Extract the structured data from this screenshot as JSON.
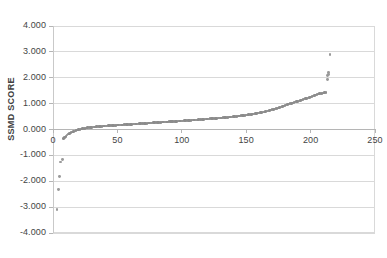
{
  "chart_data": {
    "type": "scatter",
    "title": "",
    "xlabel": "",
    "ylabel": "SSMD SCORE",
    "xlim": [
      0,
      250
    ],
    "ylim": [
      -4.0,
      4.0
    ],
    "grid": true,
    "legend": "none",
    "marker_color": "#8c8c8c",
    "gridline_color": "#d9d9d9",
    "axis_line_color": "#b5b5b5",
    "x_ticks": [
      "0",
      "50",
      "100",
      "150",
      "200",
      "250"
    ],
    "x_tick_values": [
      0,
      50,
      100,
      150,
      200,
      250
    ],
    "y_ticks": [
      "4.000",
      "3.000",
      "2.000",
      "1.000",
      "0.000",
      "-1.000",
      "-2.000",
      "-3.000",
      "-4.000"
    ],
    "y_tick_values": [
      4.0,
      3.0,
      2.0,
      1.0,
      0.0,
      -1.0,
      -2.0,
      -3.0,
      -4.0
    ],
    "series": [
      {
        "name": "SSMD score (rank ordered)",
        "x": [
          3,
          4,
          5,
          6,
          7,
          8,
          9,
          10,
          11,
          12,
          13,
          14,
          15,
          16,
          17,
          18,
          19,
          20,
          21,
          22,
          23,
          24,
          25,
          26,
          27,
          28,
          29,
          30,
          31,
          32,
          33,
          34,
          35,
          36,
          37,
          38,
          39,
          40,
          41,
          42,
          43,
          44,
          45,
          46,
          47,
          48,
          49,
          50,
          51,
          52,
          53,
          54,
          55,
          56,
          57,
          58,
          59,
          60,
          61,
          62,
          63,
          64,
          65,
          66,
          67,
          68,
          69,
          70,
          71,
          72,
          73,
          74,
          75,
          76,
          77,
          78,
          79,
          80,
          81,
          82,
          83,
          84,
          85,
          86,
          87,
          88,
          89,
          90,
          91,
          92,
          93,
          94,
          95,
          96,
          97,
          98,
          99,
          100,
          101,
          102,
          103,
          104,
          105,
          106,
          107,
          108,
          109,
          110,
          111,
          112,
          113,
          114,
          115,
          116,
          117,
          118,
          119,
          120,
          121,
          122,
          123,
          124,
          125,
          126,
          127,
          128,
          129,
          130,
          131,
          132,
          133,
          134,
          135,
          136,
          137,
          138,
          139,
          140,
          141,
          142,
          143,
          144,
          145,
          146,
          147,
          148,
          149,
          150,
          151,
          152,
          153,
          154,
          155,
          156,
          157,
          158,
          159,
          160,
          161,
          162,
          163,
          164,
          165,
          166,
          167,
          168,
          169,
          170,
          171,
          172,
          173,
          174,
          175,
          176,
          177,
          178,
          179,
          180,
          181,
          182,
          183,
          184,
          185,
          186,
          187,
          188,
          189,
          190,
          191,
          192,
          193,
          194,
          195,
          196,
          197,
          198,
          199,
          200,
          201,
          202,
          203,
          204,
          205,
          206,
          207,
          208,
          209,
          210,
          211,
          212,
          213,
          213,
          214,
          214,
          215
        ],
        "y": [
          -3.1,
          -2.3,
          -1.8,
          -1.25,
          -1.15,
          -0.34,
          -0.3,
          -0.26,
          -0.22,
          -0.18,
          -0.15,
          -0.12,
          -0.1,
          -0.08,
          -0.06,
          -0.04,
          -0.02,
          0.0,
          0.01,
          0.02,
          0.03,
          0.04,
          0.05,
          0.06,
          0.07,
          0.075,
          0.08,
          0.085,
          0.09,
          0.095,
          0.1,
          0.105,
          0.11,
          0.115,
          0.12,
          0.125,
          0.13,
          0.133,
          0.136,
          0.14,
          0.143,
          0.146,
          0.15,
          0.153,
          0.156,
          0.16,
          0.163,
          0.166,
          0.17,
          0.173,
          0.176,
          0.18,
          0.183,
          0.186,
          0.19,
          0.193,
          0.196,
          0.2,
          0.203,
          0.206,
          0.21,
          0.213,
          0.216,
          0.22,
          0.223,
          0.226,
          0.23,
          0.233,
          0.236,
          0.24,
          0.243,
          0.246,
          0.25,
          0.253,
          0.256,
          0.26,
          0.263,
          0.266,
          0.27,
          0.273,
          0.276,
          0.28,
          0.283,
          0.286,
          0.29,
          0.293,
          0.296,
          0.3,
          0.303,
          0.306,
          0.31,
          0.313,
          0.316,
          0.32,
          0.323,
          0.326,
          0.33,
          0.333,
          0.336,
          0.34,
          0.343,
          0.346,
          0.35,
          0.353,
          0.356,
          0.36,
          0.363,
          0.366,
          0.37,
          0.374,
          0.378,
          0.382,
          0.386,
          0.39,
          0.394,
          0.398,
          0.402,
          0.406,
          0.41,
          0.414,
          0.418,
          0.422,
          0.426,
          0.43,
          0.434,
          0.438,
          0.442,
          0.446,
          0.45,
          0.455,
          0.46,
          0.465,
          0.47,
          0.475,
          0.48,
          0.485,
          0.49,
          0.495,
          0.5,
          0.506,
          0.512,
          0.518,
          0.524,
          0.53,
          0.537,
          0.544,
          0.551,
          0.558,
          0.565,
          0.572,
          0.58,
          0.588,
          0.596,
          0.604,
          0.612,
          0.62,
          0.63,
          0.64,
          0.65,
          0.66,
          0.672,
          0.684,
          0.696,
          0.708,
          0.72,
          0.734,
          0.748,
          0.762,
          0.776,
          0.79,
          0.806,
          0.822,
          0.838,
          0.854,
          0.87,
          0.888,
          0.906,
          0.924,
          0.942,
          0.96,
          0.978,
          0.996,
          1.012,
          1.028,
          1.044,
          1.06,
          1.076,
          1.092,
          1.108,
          1.124,
          1.14,
          1.156,
          1.172,
          1.188,
          1.204,
          1.22,
          1.24,
          1.26,
          1.28,
          1.3,
          1.32,
          1.34,
          1.355,
          1.37,
          1.38,
          1.39,
          1.4,
          1.41,
          1.42,
          1.43,
          1.95,
          2.08,
          2.12,
          2.2,
          2.9
        ]
      }
    ],
    "notable_outliers": {
      "negative": [
        {
          "x": 3,
          "y": -3.1
        },
        {
          "x": 4,
          "y": -2.3
        },
        {
          "x": 5,
          "y": -1.8
        },
        {
          "x": 6,
          "y": -1.25
        },
        {
          "x": 7,
          "y": -1.15
        }
      ],
      "positive": [
        {
          "x": 213,
          "y": 1.95
        },
        {
          "x": 213,
          "y": 2.08
        },
        {
          "x": 214,
          "y": 2.12
        },
        {
          "x": 214,
          "y": 2.2
        },
        {
          "x": 215,
          "y": 2.9
        }
      ]
    }
  }
}
